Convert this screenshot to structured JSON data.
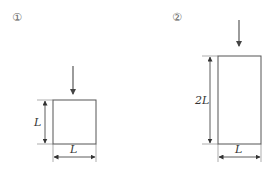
{
  "figures": [
    {
      "id": "1",
      "marker": "①",
      "shape": "square",
      "height_label": "L",
      "width_label": "L",
      "load": "downward-arrow"
    },
    {
      "id": "2",
      "marker": "②",
      "shape": "rectangle",
      "height_label": "2L",
      "width_label": "L",
      "load": "downward-arrow"
    }
  ],
  "colors": {
    "stroke": "#555555",
    "arrow": "#666666",
    "text": "#333333"
  }
}
